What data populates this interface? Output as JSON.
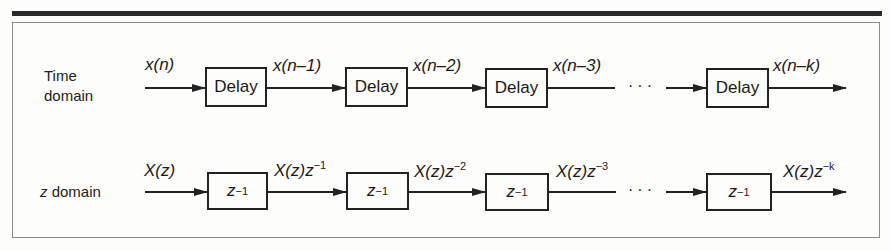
{
  "figure": {
    "rows": [
      {
        "label_line1": "Time",
        "label_line2": "domain",
        "box_label": "Delay",
        "signals": [
          {
            "base": "x(n)",
            "exp": ""
          },
          {
            "base": "x(n–1)",
            "exp": ""
          },
          {
            "base": "x(n–2)",
            "exp": ""
          },
          {
            "base": "x(n–3)",
            "exp": ""
          },
          {
            "base": "x(n–k)",
            "exp": ""
          }
        ],
        "ellipsis": "···"
      },
      {
        "label_line1": "z domain",
        "box_label": "z",
        "box_exp": "−1",
        "signals": [
          {
            "base": "X(z)",
            "exp": ""
          },
          {
            "base": "X(z)z",
            "exp": "−1"
          },
          {
            "base": "X(z)z",
            "exp": "−2"
          },
          {
            "base": "X(z)z",
            "exp": "−3"
          },
          {
            "base": "X(z)z",
            "exp": "−k"
          }
        ],
        "ellipsis": "···"
      }
    ]
  }
}
